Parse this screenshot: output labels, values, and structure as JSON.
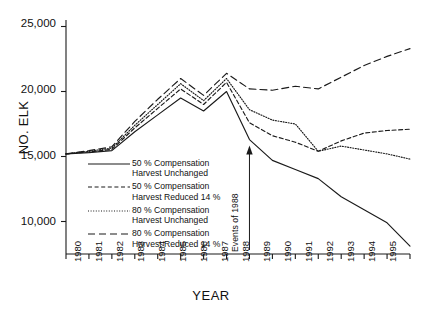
{
  "chart_data": {
    "type": "line",
    "title": "",
    "xlabel": "YEAR",
    "ylabel": "NO. ELK",
    "x": [
      1980,
      1981,
      1982,
      1983,
      1984,
      1985,
      1986,
      1987,
      1988,
      1989,
      1990,
      1991,
      1992,
      1993,
      1994,
      1995
    ],
    "categories": [
      "1980",
      "1981",
      "1982",
      "1983",
      "1984",
      "1985",
      "1986",
      "1987",
      "1988",
      "1989",
      "1990",
      "1991",
      "1992",
      "1993",
      "1994",
      "1995"
    ],
    "xlim": [
      1980,
      1995
    ],
    "ylim": [
      7500,
      25500
    ],
    "yticks": [
      10000,
      15000,
      20000,
      25000
    ],
    "ytick_labels": [
      "10,000",
      "15,000",
      "20,000",
      "25,000"
    ],
    "grid": false,
    "legend_position": "inside-left",
    "series": [
      {
        "name": "50 % Compensation Harvest Unchanged",
        "label_line1": "50 % Compensation",
        "label_line2": "Harvest Unchanged",
        "style": "solid",
        "color": "#1a1a1a",
        "values": [
          15200,
          15300,
          15450,
          16900,
          18200,
          19500,
          18500,
          20000,
          16300,
          14700,
          14000,
          13300,
          11900,
          10900,
          9900,
          8100
        ]
      },
      {
        "name": "50 % Compensation Harvest Reduced 14 %",
        "label_line1": "50 % Compensation",
        "label_line2": "Harvest Reduced 14 %",
        "style": "dashed-short",
        "color": "#1a1a1a",
        "values": [
          15200,
          15350,
          15550,
          17200,
          18700,
          20200,
          19000,
          20700,
          17600,
          16600,
          16100,
          15400,
          16200,
          16800,
          17000,
          17100
        ]
      },
      {
        "name": "80 % Compensation Harvest Unchanged",
        "label_line1": "80 % Compensation",
        "label_line2": "Harvest Unchanged",
        "style": "dotted",
        "color": "#1a1a1a",
        "values": [
          15200,
          15400,
          15650,
          17400,
          19000,
          20600,
          19300,
          21000,
          18600,
          17800,
          17500,
          15400,
          15800,
          15500,
          15200,
          14800
        ]
      },
      {
        "name": "80 % Compensation Harvest Reduced 14 %",
        "label_line1": "80 % Compensation",
        "label_line2": "Harvest Reduced 14 %",
        "style": "dashed-long",
        "color": "#1a1a1a",
        "values": [
          15200,
          15450,
          15750,
          17700,
          19400,
          21000,
          19700,
          21400,
          20200,
          20100,
          20400,
          20200,
          21100,
          22000,
          22700,
          23300
        ]
      }
    ],
    "annotations": [
      {
        "text": "Events of 1988",
        "x": 1988,
        "arrow": "up",
        "arrow_tip_value": 16300
      }
    ]
  }
}
